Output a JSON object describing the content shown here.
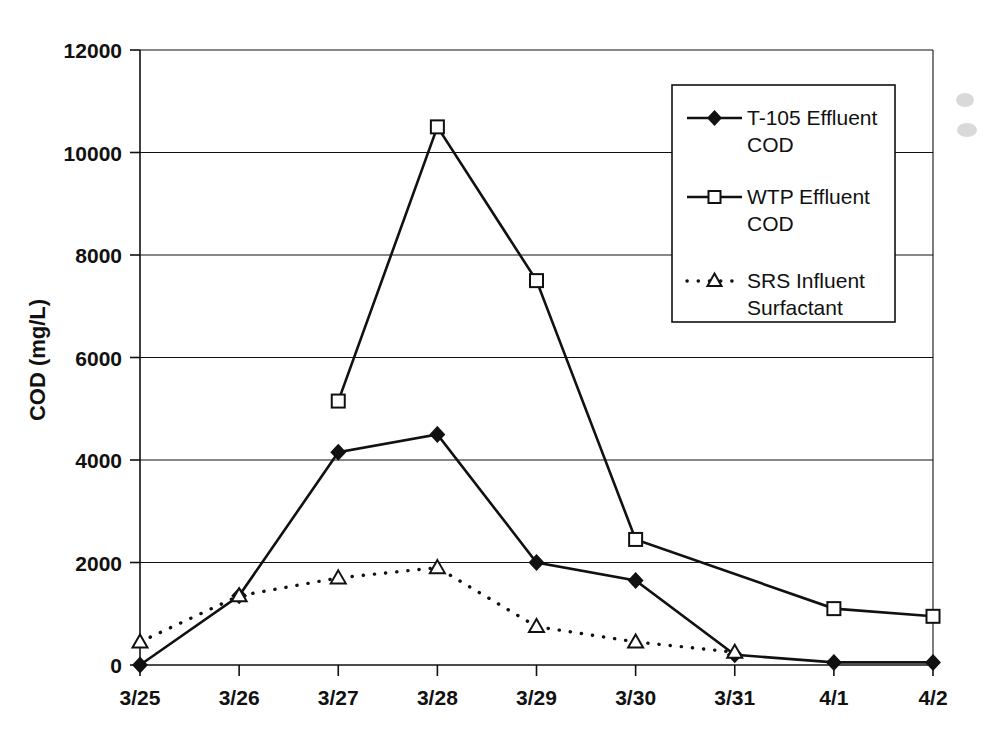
{
  "chart_data": {
    "type": "line",
    "title": "",
    "xlabel": "",
    "ylabel": "COD (mg/L)",
    "categories": [
      "3/25",
      "3/26",
      "3/27",
      "3/28",
      "3/29",
      "3/30",
      "3/31",
      "4/1",
      "4/2"
    ],
    "ylim": [
      0,
      12000
    ],
    "yticks": [
      0,
      2000,
      4000,
      6000,
      8000,
      10000,
      12000
    ],
    "ytick_labels": [
      "0",
      "2000",
      "4000",
      "6000",
      "8000",
      "10000",
      "12000"
    ],
    "grid": true,
    "legend_position": "top-right",
    "series": [
      {
        "name": "T-105 Effluent COD",
        "marker": "filled-diamond",
        "line_style": "solid",
        "color": "#111111",
        "values": [
          0,
          1350,
          4150,
          4500,
          2000,
          1650,
          200,
          50,
          50
        ]
      },
      {
        "name": "WTP Effluent COD",
        "marker": "open-square",
        "line_style": "solid",
        "color": "#111111",
        "values": [
          null,
          null,
          5150,
          10500,
          7500,
          2450,
          null,
          1100,
          950
        ]
      },
      {
        "name": "SRS Influent Surfactant",
        "marker": "open-triangle",
        "line_style": "dotted",
        "color": "#111111",
        "values": [
          450,
          1350,
          1700,
          1900,
          750,
          450,
          250,
          null,
          null
        ]
      }
    ]
  },
  "legend": {
    "entries": [
      {
        "label_line1": "T-105 Effluent",
        "label_line2": "COD"
      },
      {
        "label_line1": "WTP Effluent",
        "label_line2": "COD"
      },
      {
        "label_line1": "SRS Influent",
        "label_line2": "Surfactant"
      }
    ]
  },
  "axis": {
    "y_title": "COD (mg/L)"
  }
}
